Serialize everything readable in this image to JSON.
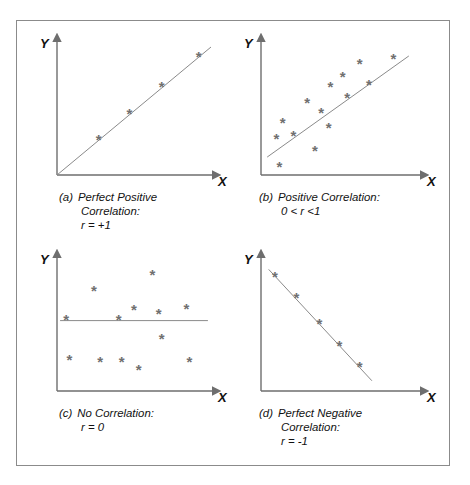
{
  "figure": {
    "axis_label_x": "X",
    "axis_label_y": "Y",
    "marker_glyph": "*",
    "colors": {
      "frame": "#8b8b8b",
      "axis": "#6e6e6e",
      "trend_line": "#8a8a8a",
      "marker": "#707070",
      "text": "#111111",
      "background": "#ffffff"
    }
  },
  "panels": [
    {
      "id": "a",
      "tag": "(a)",
      "caption_lines": [
        "Perfect Positive",
        "Correlation:",
        "r = +1"
      ],
      "chart": {
        "type": "scatter",
        "title": "Perfect Positive Correlation",
        "xlabel": "X",
        "ylabel": "Y",
        "r": "+1",
        "trend_line": {
          "x1": 0,
          "y1": 0,
          "x2": 100,
          "y2": 100
        },
        "points": [
          {
            "x": 27,
            "y": 27
          },
          {
            "x": 47,
            "y": 47
          },
          {
            "x": 68,
            "y": 68
          },
          {
            "x": 92,
            "y": 92
          }
        ]
      }
    },
    {
      "id": "b",
      "tag": "(b)",
      "caption_lines": [
        "Positive Correlation:",
        "0 < r <1"
      ],
      "chart": {
        "type": "scatter",
        "title": "Positive Correlation",
        "xlabel": "X",
        "ylabel": "Y",
        "r": "0 < r < 1",
        "trend_line": {
          "x1": 4,
          "y1": 14,
          "x2": 96,
          "y2": 93
        },
        "points": [
          {
            "x": 12,
            "y": 6
          },
          {
            "x": 10,
            "y": 28
          },
          {
            "x": 21,
            "y": 30
          },
          {
            "x": 14,
            "y": 40
          },
          {
            "x": 35,
            "y": 18
          },
          {
            "x": 39,
            "y": 48
          },
          {
            "x": 30,
            "y": 56
          },
          {
            "x": 44,
            "y": 36
          },
          {
            "x": 45,
            "y": 68
          },
          {
            "x": 56,
            "y": 60
          },
          {
            "x": 53,
            "y": 76
          },
          {
            "x": 64,
            "y": 86
          },
          {
            "x": 70,
            "y": 70
          },
          {
            "x": 86,
            "y": 90
          }
        ]
      }
    },
    {
      "id": "c",
      "tag": "(c)",
      "caption_lines": [
        "No Correlation:",
        "r = 0"
      ],
      "chart": {
        "type": "scatter",
        "title": "No Correlation",
        "xlabel": "X",
        "ylabel": "Y",
        "r": "0",
        "trend_line": {
          "x1": 2,
          "y1": 55,
          "x2": 98,
          "y2": 55
        },
        "points": [
          {
            "x": 6,
            "y": 55
          },
          {
            "x": 8,
            "y": 24
          },
          {
            "x": 24,
            "y": 78
          },
          {
            "x": 28,
            "y": 22
          },
          {
            "x": 40,
            "y": 55
          },
          {
            "x": 42,
            "y": 22
          },
          {
            "x": 50,
            "y": 63
          },
          {
            "x": 53,
            "y": 16
          },
          {
            "x": 62,
            "y": 90
          },
          {
            "x": 66,
            "y": 60
          },
          {
            "x": 68,
            "y": 40
          },
          {
            "x": 84,
            "y": 64
          },
          {
            "x": 86,
            "y": 22
          }
        ]
      }
    },
    {
      "id": "d",
      "tag": "(d)",
      "caption_lines": [
        "Perfect Negative",
        "Correlation:",
        "r = -1"
      ],
      "chart": {
        "type": "scatter",
        "title": "Perfect Negative Correlation",
        "xlabel": "X",
        "ylabel": "Y",
        "r": "-1",
        "trend_line": {
          "x1": 5,
          "y1": 95,
          "x2": 72,
          "y2": 8
        },
        "points": [
          {
            "x": 9,
            "y": 89
          },
          {
            "x": 23,
            "y": 72
          },
          {
            "x": 38,
            "y": 52
          },
          {
            "x": 51,
            "y": 35
          },
          {
            "x": 64,
            "y": 18
          }
        ]
      }
    }
  ]
}
